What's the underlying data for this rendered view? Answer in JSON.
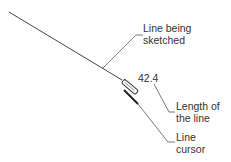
{
  "labels": {
    "line_being_sketched": [
      "Line being",
      "sketched"
    ],
    "dimension_value": "42.4",
    "length_of_line": [
      "Length of",
      "the line"
    ],
    "line_cursor": [
      "Line",
      "cursor"
    ]
  },
  "colors": {
    "line": "#333333",
    "text": "#333333",
    "background": "#ffffff"
  }
}
